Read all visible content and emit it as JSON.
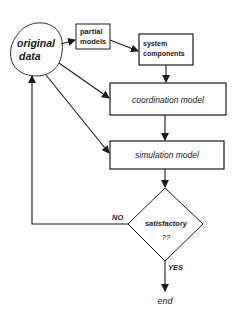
{
  "diagram": {
    "type": "flowchart",
    "nodes": {
      "original_data": {
        "line1": "original",
        "line2": "data",
        "shape": "cloud"
      },
      "partial_models": {
        "line1": "partial",
        "line2": "models",
        "shape": "box"
      },
      "system_components": {
        "line1": "system",
        "line2": "components",
        "shape": "box"
      },
      "coordination_model": {
        "label": "coordination model",
        "shape": "box"
      },
      "simulation_model": {
        "label": "simulation model",
        "shape": "box"
      },
      "decision": {
        "line1": "satisfactory",
        "line2": "??",
        "shape": "diamond"
      },
      "end": {
        "label": "end",
        "shape": "terminal-text"
      }
    },
    "edges": [
      {
        "from": "original_data",
        "to": "partial_models"
      },
      {
        "from": "partial_models",
        "to": "system_components"
      },
      {
        "from": "system_components",
        "to": "coordination_model"
      },
      {
        "from": "original_data",
        "to": "coordination_model"
      },
      {
        "from": "original_data",
        "to": "simulation_model"
      },
      {
        "from": "coordination_model",
        "to": "simulation_model"
      },
      {
        "from": "simulation_model",
        "to": "decision"
      },
      {
        "from": "decision",
        "to": "original_data",
        "label": "NO"
      },
      {
        "from": "decision",
        "to": "end",
        "label": "YES"
      }
    ],
    "edge_labels": {
      "no": "NO",
      "yes": "YES"
    },
    "colors": {
      "stroke": "#1a1a1a",
      "background": "#ffffff"
    }
  }
}
